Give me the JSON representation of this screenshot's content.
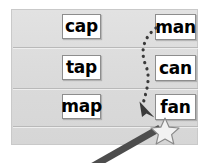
{
  "activity": {
    "title": "Word family matching worksheet",
    "panel": {
      "background_color": "#dcdcdc",
      "border_color": "#c9c9c9",
      "rows": 3
    },
    "columns": {
      "left": {
        "name": "ap-words",
        "cards": [
          {
            "label": "cap"
          },
          {
            "label": "tap"
          },
          {
            "label": "map"
          }
        ]
      },
      "right": {
        "name": "an-words",
        "cards": [
          {
            "label": "man"
          },
          {
            "label": "can"
          },
          {
            "label": "fan"
          }
        ]
      }
    },
    "annotations": {
      "dotted_path": {
        "name": "dotted-drag-path",
        "from_card": "man",
        "to_card": "fan",
        "color": "#3a3a3a",
        "style": "dotted"
      },
      "arrowhead": {
        "name": "path-arrowhead",
        "color": "#3a3a3a",
        "direction": "down-right"
      },
      "cursor": {
        "name": "magic-wand-cursor",
        "tip_sparkle": "star",
        "wand_color": "#4a4a4a",
        "star_fill": "#f0f0f0",
        "star_stroke": "#8a8a8a"
      }
    },
    "colors": {
      "card_fill": "#ffffff",
      "card_border": "#8d8d8d",
      "text": "#000000",
      "divider": "#b9b9b9",
      "page": "#ffffff"
    }
  }
}
